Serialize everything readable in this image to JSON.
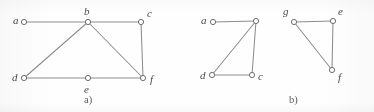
{
  "figure": {
    "background_color": "#fefefe",
    "edge_color": "#8d8d8d",
    "vertex_stroke_color": "#6f6f6f",
    "vertex_fill_color": "#ffffff",
    "label_color": "#4a4a4a",
    "vertex_radius": 2.6
  },
  "panels": [
    {
      "caption": "a)",
      "caption_x": 84,
      "caption_y": 95,
      "vertices": [
        {
          "id": "a",
          "label": "a",
          "x": 24,
          "y": 22,
          "label_x": 13,
          "label_y": 15
        },
        {
          "id": "b",
          "label": "b",
          "x": 88,
          "y": 22,
          "label_x": 84,
          "label_y": 6
        },
        {
          "id": "c",
          "label": "c",
          "x": 141,
          "y": 22,
          "label_x": 147,
          "label_y": 8
        },
        {
          "id": "d",
          "label": "d",
          "x": 24,
          "y": 78,
          "label_x": 12,
          "label_y": 72
        },
        {
          "id": "e",
          "label": "e",
          "x": 88,
          "y": 78,
          "label_x": 84,
          "label_y": 84
        },
        {
          "id": "f",
          "label": "f",
          "x": 143,
          "y": 78,
          "label_x": 150,
          "label_y": 74
        }
      ],
      "edges": [
        {
          "from": "a",
          "to": "b"
        },
        {
          "from": "b",
          "to": "c"
        },
        {
          "from": "b",
          "to": "d"
        },
        {
          "from": "b",
          "to": "f"
        },
        {
          "from": "c",
          "to": "f"
        },
        {
          "from": "d",
          "to": "e"
        },
        {
          "from": "e",
          "to": "f"
        }
      ]
    },
    {
      "caption": "b)",
      "caption_x": 289,
      "caption_y": 95,
      "vertices": [
        {
          "id": "a2",
          "label": "a",
          "x": 213,
          "y": 22,
          "label_x": 201,
          "label_y": 15
        },
        {
          "id": "b2",
          "label": "",
          "x": 256,
          "y": 21,
          "label_x": 252,
          "label_y": 5
        },
        {
          "id": "d2",
          "label": "d",
          "x": 212,
          "y": 75,
          "label_x": 200,
          "label_y": 70
        },
        {
          "id": "c2",
          "label": "c",
          "x": 252,
          "y": 75,
          "label_x": 258,
          "label_y": 71
        },
        {
          "id": "g2",
          "label": "g",
          "x": 294,
          "y": 22,
          "label_x": 283,
          "label_y": 6
        },
        {
          "id": "e2",
          "label": "e",
          "x": 333,
          "y": 21,
          "label_x": 338,
          "label_y": 6
        },
        {
          "id": "f2",
          "label": "f",
          "x": 332,
          "y": 70,
          "label_x": 338,
          "label_y": 72
        }
      ],
      "edges": [
        {
          "from": "a2",
          "to": "b2"
        },
        {
          "from": "b2",
          "to": "d2"
        },
        {
          "from": "b2",
          "to": "c2"
        },
        {
          "from": "d2",
          "to": "c2"
        },
        {
          "from": "g2",
          "to": "e2"
        },
        {
          "from": "g2",
          "to": "f2"
        },
        {
          "from": "e2",
          "to": "f2"
        }
      ]
    }
  ]
}
